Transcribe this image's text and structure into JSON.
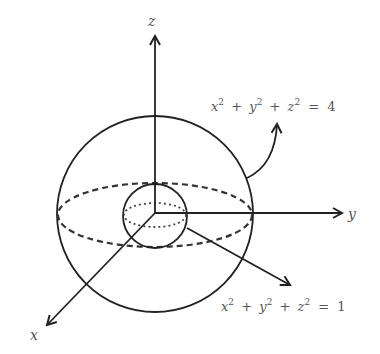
{
  "diagram": {
    "axes": {
      "x": {
        "label": "x"
      },
      "y": {
        "label": "y"
      },
      "z": {
        "label": "z"
      }
    },
    "outer_sphere": {
      "equation": {
        "terms": [
          "x",
          "y",
          "z"
        ],
        "exponent": "2",
        "plus": "+",
        "equals": "=",
        "rhs": "4"
      },
      "radius": 2
    },
    "inner_sphere": {
      "equation": {
        "terms": [
          "x",
          "y",
          "z"
        ],
        "exponent": "2",
        "plus": "+",
        "equals": "=",
        "rhs": "1"
      },
      "radius": 1
    },
    "colors": {
      "stroke": "#222222",
      "label": "#555555",
      "background": "#ffffff"
    }
  }
}
